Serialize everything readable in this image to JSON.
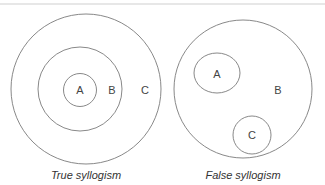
{
  "diagrams": [
    {
      "caption": "True syllogism",
      "sets": [
        {
          "label": "A",
          "relation": "innermost, contained in B"
        },
        {
          "label": "B",
          "relation": "contains A, contained in C"
        },
        {
          "label": "C",
          "relation": "outermost, contains B"
        }
      ]
    },
    {
      "caption": "False syllogism",
      "sets": [
        {
          "label": "A",
          "relation": "contained in B, disjoint from C"
        },
        {
          "label": "B",
          "relation": "contains A and C"
        },
        {
          "label": "C",
          "relation": "contained in B, disjoint from A"
        }
      ]
    }
  ],
  "colors": {
    "stroke": "#7a7a7a",
    "text": "#444444",
    "rule": "#cfcfcf"
  }
}
